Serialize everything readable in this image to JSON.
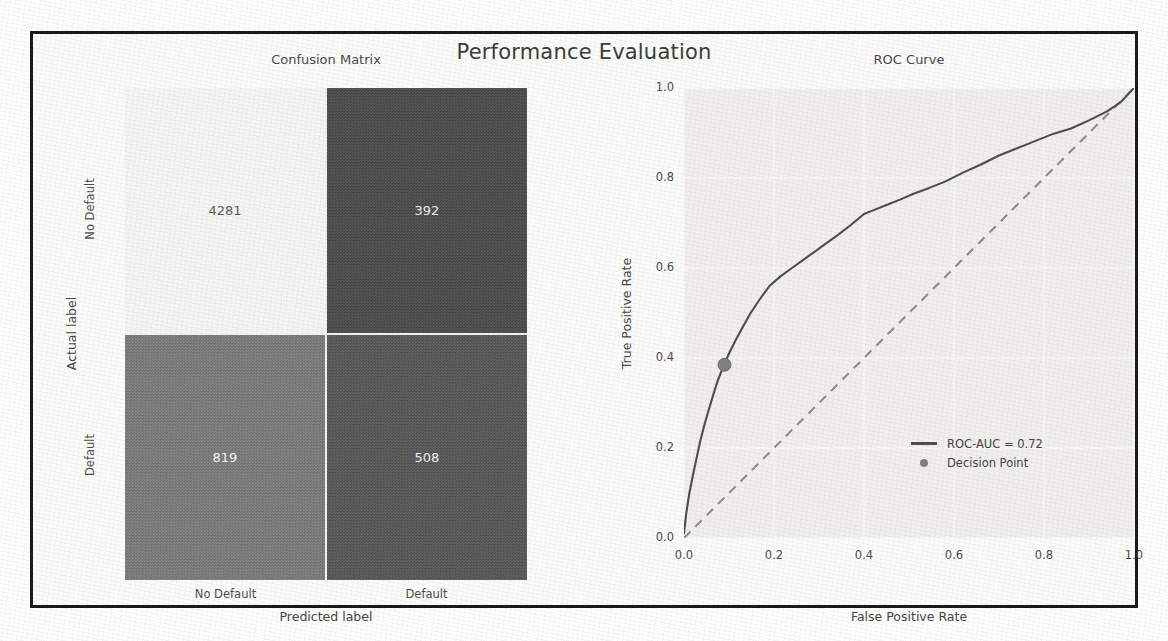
{
  "figure": {
    "suptitle": "Performance Evaluation",
    "frame_color": "#1a1a1a",
    "page_background": "#fdfdfc"
  },
  "confusion_matrix": {
    "title": "Confusion Matrix",
    "xlabel": "Predicted label",
    "ylabel": "Actual label",
    "x_ticks": [
      "No Default",
      "Default"
    ],
    "y_ticks": [
      "No Default",
      "Default"
    ],
    "cells": [
      {
        "name": "true-negative",
        "value": "4281",
        "fill": "#f7f7f5",
        "text_color": "#5c5c5c"
      },
      {
        "name": "false-positive",
        "value": "392",
        "fill": "#4a4a4a",
        "text_color": "#e9e9e9"
      },
      {
        "name": "false-negative",
        "value": "819",
        "fill": "#7b7b7b",
        "text_color": "#f2f2f2"
      },
      {
        "name": "true-positive",
        "value": "508",
        "fill": "#565656",
        "text_color": "#ececec"
      }
    ]
  },
  "roc": {
    "title": "ROC Curve",
    "legend": {
      "roc_label": "ROC-AUC = 0.72",
      "decision_label": "Decision Point"
    }
  },
  "chart_data": [
    {
      "type": "heatmap",
      "title": "Confusion Matrix",
      "xlabel": "Predicted label",
      "ylabel": "Actual label",
      "x_categories": [
        "No Default",
        "Default"
      ],
      "y_categories": [
        "No Default",
        "Default"
      ],
      "values": [
        [
          4281,
          392
        ],
        [
          819,
          508
        ]
      ],
      "colormap": "greys_reversed",
      "annotations": [
        "4281",
        "392",
        "819",
        "508"
      ]
    },
    {
      "type": "line",
      "title": "ROC Curve",
      "xlabel": "False Positive Rate",
      "ylabel": "True Positive Rate",
      "xlim": [
        0.0,
        1.0
      ],
      "ylim": [
        0.0,
        1.0
      ],
      "x_ticks": [
        "0.0",
        "0.2",
        "0.4",
        "0.6",
        "0.8",
        "1.0"
      ],
      "y_ticks": [
        "0.0",
        "0.2",
        "0.4",
        "0.6",
        "0.8",
        "1.0"
      ],
      "x_tick_values": [
        0.0,
        0.2,
        0.4,
        0.6,
        0.8,
        1.0
      ],
      "y_tick_values": [
        0.0,
        0.2,
        0.4,
        0.6,
        0.8,
        1.0
      ],
      "grid": true,
      "legend_position": "lower right",
      "roc_auc": 0.72,
      "series": [
        {
          "name": "ROC-AUC = 0.72",
          "style": "solid",
          "color": "#4e4e4e",
          "x": [
            0.0,
            0.005,
            0.012,
            0.02,
            0.028,
            0.036,
            0.045,
            0.055,
            0.065,
            0.075,
            0.088,
            0.1,
            0.115,
            0.13,
            0.148,
            0.168,
            0.19,
            0.215,
            0.24,
            0.265,
            0.29,
            0.315,
            0.34,
            0.37,
            0.4,
            0.42,
            0.45,
            0.48,
            0.51,
            0.545,
            0.58,
            0.62,
            0.66,
            0.7,
            0.74,
            0.78,
            0.82,
            0.86,
            0.9,
            0.94,
            0.97,
            1.0
          ],
          "y": [
            0.01,
            0.055,
            0.1,
            0.14,
            0.178,
            0.215,
            0.25,
            0.285,
            0.318,
            0.35,
            0.382,
            0.41,
            0.44,
            0.468,
            0.5,
            0.53,
            0.56,
            0.582,
            0.6,
            0.618,
            0.636,
            0.654,
            0.672,
            0.695,
            0.72,
            0.728,
            0.74,
            0.752,
            0.765,
            0.778,
            0.792,
            0.812,
            0.83,
            0.85,
            0.866,
            0.882,
            0.898,
            0.91,
            0.928,
            0.948,
            0.968,
            1.0
          ]
        },
        {
          "name": "chance",
          "style": "dashed",
          "color": "#8e8e8e",
          "x": [
            0.0,
            1.0
          ],
          "y": [
            0.0,
            1.0
          ]
        }
      ],
      "points": [
        {
          "name": "Decision Point",
          "x": 0.09,
          "y": 0.385,
          "color": "#828282",
          "marker": "o"
        }
      ]
    }
  ]
}
